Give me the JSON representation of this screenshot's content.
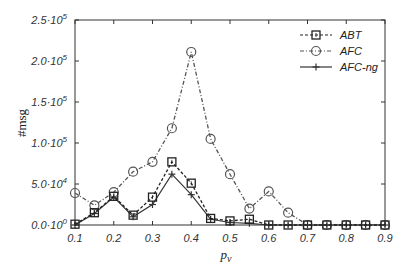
{
  "chart_data": {
    "type": "line",
    "title": "",
    "xlabel": "p_v",
    "xlabel_main": "p",
    "xlabel_sub": "v",
    "ylabel": "#msg",
    "xlim": [
      0.1,
      0.9
    ],
    "ylim": [
      0,
      250000
    ],
    "x_ticks": [
      0.1,
      0.2,
      0.3,
      0.4,
      0.5,
      0.6,
      0.7,
      0.8,
      0.9
    ],
    "x_tick_labels": [
      "0.1",
      "0.2",
      "0.3",
      "0.4",
      "0.5",
      "0.6",
      "0.7",
      "0.8",
      "0.9"
    ],
    "y_ticks": [
      0,
      50000,
      100000,
      150000,
      200000,
      250000
    ],
    "y_tick_labels": [
      {
        "mant": "0.0·10",
        "exp": "0"
      },
      {
        "mant": "5.0·10",
        "exp": "4"
      },
      {
        "mant": "1.0·10",
        "exp": "5"
      },
      {
        "mant": "1.5·10",
        "exp": "5"
      },
      {
        "mant": "2.0·10",
        "exp": "5"
      },
      {
        "mant": "2.5·10",
        "exp": "5"
      }
    ],
    "grid": false,
    "legend_position": "upper right",
    "x": [
      0.1,
      0.15,
      0.2,
      0.25,
      0.3,
      0.35,
      0.4,
      0.45,
      0.5,
      0.55,
      0.6,
      0.65,
      0.7,
      0.75,
      0.8,
      0.85,
      0.9
    ],
    "series": [
      {
        "name": "ABT",
        "marker": "square",
        "line": "dashed",
        "color": "#222222",
        "values": [
          1000,
          15000,
          35000,
          12000,
          34000,
          77000,
          51000,
          8000,
          5000,
          7000,
          0,
          0,
          0,
          0,
          0,
          0,
          0
        ]
      },
      {
        "name": "AFC",
        "marker": "circle",
        "line": "dash-dot",
        "color": "#555555",
        "values": [
          39000,
          24000,
          40000,
          65000,
          77000,
          118000,
          211000,
          105000,
          62000,
          20000,
          41000,
          15000,
          0,
          0,
          0,
          0,
          0
        ]
      },
      {
        "name": "AFC-ng",
        "marker": "plus",
        "line": "solid",
        "color": "#333333",
        "values": [
          0,
          14000,
          34000,
          10000,
          25000,
          62000,
          37000,
          7000,
          3000,
          2000,
          0,
          0,
          0,
          0,
          0,
          0,
          0
        ]
      }
    ]
  }
}
